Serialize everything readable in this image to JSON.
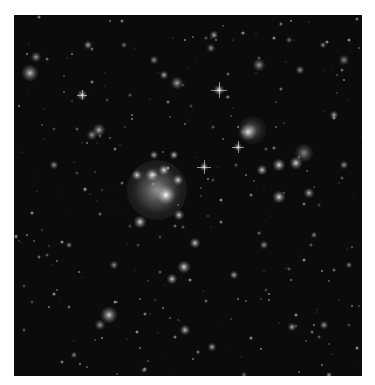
{
  "image": {
    "subject": "galaxy cluster deep field",
    "background": "#0b0b0b",
    "frame": {
      "x": 14,
      "y": 15,
      "width": 348,
      "height": 361
    }
  },
  "objects": [
    {
      "x": 143,
      "y": 175,
      "r": 30,
      "b": 0.55
    },
    {
      "x": 152,
      "y": 180,
      "r": 9,
      "b": 1
    },
    {
      "x": 138,
      "y": 160,
      "r": 6,
      "b": 0.9
    },
    {
      "x": 150,
      "y": 155,
      "r": 5,
      "b": 0.9
    },
    {
      "x": 123,
      "y": 160,
      "r": 5,
      "b": 0.85
    },
    {
      "x": 164,
      "y": 165,
      "r": 5,
      "b": 0.85
    },
    {
      "x": 160,
      "y": 140,
      "r": 4,
      "b": 0.8
    },
    {
      "x": 140,
      "y": 140,
      "r": 4,
      "b": 0.7
    },
    {
      "x": 165,
      "y": 200,
      "r": 5,
      "b": 0.8
    },
    {
      "x": 126,
      "y": 207,
      "r": 6,
      "b": 0.85
    },
    {
      "x": 181,
      "y": 228,
      "r": 5,
      "b": 0.8
    },
    {
      "x": 170,
      "y": 252,
      "r": 6,
      "b": 0.85
    },
    {
      "x": 158,
      "y": 264,
      "r": 5,
      "b": 0.8
    },
    {
      "x": 234,
      "y": 117,
      "r": 8,
      "b": 0.9
    },
    {
      "x": 238,
      "y": 115,
      "r": 14,
      "b": 0.35
    },
    {
      "x": 265,
      "y": 150,
      "r": 6,
      "b": 0.85
    },
    {
      "x": 282,
      "y": 148,
      "r": 6,
      "b": 0.85
    },
    {
      "x": 290,
      "y": 138,
      "r": 9,
      "b": 0.5
    },
    {
      "x": 248,
      "y": 155,
      "r": 5,
      "b": 0.8
    },
    {
      "x": 265,
      "y": 182,
      "r": 6,
      "b": 0.85
    },
    {
      "x": 295,
      "y": 178,
      "r": 5,
      "b": 0.7
    },
    {
      "x": 224,
      "y": 132,
      "r": 4,
      "b": 0.8
    },
    {
      "x": 190,
      "y": 152,
      "r": 4,
      "b": 0.8
    },
    {
      "x": 16,
      "y": 58,
      "r": 8,
      "b": 0.75
    },
    {
      "x": 22,
      "y": 42,
      "r": 5,
      "b": 0.6
    },
    {
      "x": 74,
      "y": 30,
      "r": 4,
      "b": 0.7
    },
    {
      "x": 68,
      "y": 80,
      "r": 5,
      "b": 0.75
    },
    {
      "x": 150,
      "y": 60,
      "r": 4,
      "b": 0.7
    },
    {
      "x": 163,
      "y": 68,
      "r": 6,
      "b": 0.65
    },
    {
      "x": 197,
      "y": 33,
      "r": 4,
      "b": 0.6
    },
    {
      "x": 245,
      "y": 50,
      "r": 6,
      "b": 0.6
    },
    {
      "x": 286,
      "y": 55,
      "r": 4,
      "b": 0.6
    },
    {
      "x": 309,
      "y": 30,
      "r": 3,
      "b": 0.6
    },
    {
      "x": 85,
      "y": 115,
      "r": 6,
      "b": 0.7
    },
    {
      "x": 78,
      "y": 120,
      "r": 5,
      "b": 0.6
    },
    {
      "x": 205,
      "y": 75,
      "r": 5,
      "b": 0.9
    },
    {
      "x": 200,
      "y": 20,
      "r": 4,
      "b": 0.7
    },
    {
      "x": 140,
      "y": 45,
      "r": 4,
      "b": 0.6
    },
    {
      "x": 320,
      "y": 100,
      "r": 4,
      "b": 0.7
    },
    {
      "x": 330,
      "y": 150,
      "r": 4,
      "b": 0.6
    },
    {
      "x": 95,
      "y": 300,
      "r": 8,
      "b": 0.8
    },
    {
      "x": 86,
      "y": 310,
      "r": 5,
      "b": 0.6
    },
    {
      "x": 171,
      "y": 315,
      "r": 5,
      "b": 0.75
    },
    {
      "x": 198,
      "y": 332,
      "r": 4,
      "b": 0.7
    },
    {
      "x": 278,
      "y": 312,
      "r": 4,
      "b": 0.7
    },
    {
      "x": 310,
      "y": 310,
      "r": 4,
      "b": 0.65
    },
    {
      "x": 315,
      "y": 360,
      "r": 3,
      "b": 0.7
    },
    {
      "x": 40,
      "y": 150,
      "r": 4,
      "b": 0.6
    },
    {
      "x": 55,
      "y": 230,
      "r": 3,
      "b": 0.6
    },
    {
      "x": 100,
      "y": 250,
      "r": 4,
      "b": 0.6
    },
    {
      "x": 220,
      "y": 260,
      "r": 4,
      "b": 0.7
    },
    {
      "x": 250,
      "y": 230,
      "r": 4,
      "b": 0.6
    },
    {
      "x": 300,
      "y": 220,
      "r": 3,
      "b": 0.6
    },
    {
      "x": 335,
      "y": 250,
      "r": 3,
      "b": 0.6
    },
    {
      "x": 60,
      "y": 340,
      "r": 3,
      "b": 0.6
    },
    {
      "x": 130,
      "y": 355,
      "r": 3,
      "b": 0.5
    },
    {
      "x": 230,
      "y": 360,
      "r": 3,
      "b": 0.5
    },
    {
      "x": 275,
      "y": 25,
      "r": 3,
      "b": 0.5
    },
    {
      "x": 110,
      "y": 30,
      "r": 3,
      "b": 0.5
    },
    {
      "x": 330,
      "y": 45,
      "r": 5,
      "b": 0.55
    }
  ],
  "stars": [
    {
      "x": 205,
      "y": 75,
      "len": 16
    },
    {
      "x": 190,
      "y": 152,
      "len": 14
    },
    {
      "x": 224,
      "y": 132,
      "len": 12
    },
    {
      "x": 68,
      "y": 80,
      "len": 10
    }
  ]
}
